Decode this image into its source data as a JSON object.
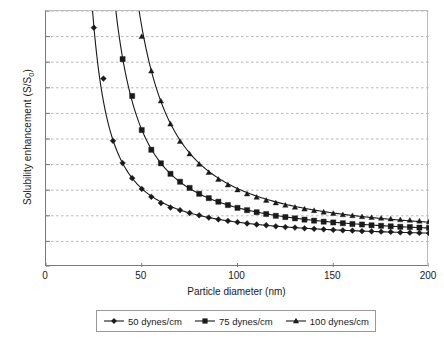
{
  "chart_data": {
    "type": "line",
    "title": "",
    "xlabel": "Particle diameter (nm)",
    "ylabel": "Solubility enhancement (S/S0)",
    "ylabel_main": "Solubility enhancement (S/S",
    "ylabel_sub": "0",
    "ylabel_tail": ")",
    "xlim": [
      0,
      200
    ],
    "ylim": [
      0,
      10
    ],
    "xticks": [
      0,
      50,
      100,
      150,
      200
    ],
    "yticks": [
      0,
      1,
      2,
      3,
      4,
      5,
      6,
      7,
      8,
      9,
      10
    ],
    "grid": "horizontal-dashed",
    "legend_position": "bottom-outside",
    "marker_step_nm": 5,
    "series": [
      {
        "name": "50 dynes/cm",
        "marker": "diamond",
        "color": "#1a1a1a",
        "k_nm": 56,
        "x": [
          25,
          30,
          35,
          40,
          45,
          50,
          55,
          60,
          65,
          70,
          75,
          80,
          85,
          90,
          95,
          100,
          105,
          110,
          115,
          120,
          125,
          130,
          135,
          140,
          145,
          150,
          155,
          160,
          165,
          170,
          175,
          180,
          185,
          190,
          195,
          200
        ],
        "y": [
          9.35,
          7.36,
          4.93,
          4.06,
          3.47,
          3.05,
          2.74,
          2.5,
          2.32,
          2.22,
          2.11,
          2.02,
          1.93,
          1.86,
          1.8,
          1.75,
          1.7,
          1.66,
          1.63,
          1.59,
          1.56,
          1.54,
          1.51,
          1.49,
          1.47,
          1.45,
          1.43,
          1.42,
          1.4,
          1.39,
          1.38,
          1.37,
          1.35,
          1.34,
          1.33,
          1.32
        ]
      },
      {
        "name": "75 dynes/cm",
        "marker": "square",
        "color": "#1a1a1a",
        "k_nm": 84,
        "x": [
          35,
          40,
          45,
          50,
          55,
          60,
          65,
          70,
          75,
          80,
          85,
          90,
          95,
          100,
          105,
          110,
          115,
          120,
          125,
          130,
          135,
          140,
          145,
          150,
          155,
          160,
          165,
          170,
          175,
          180,
          185,
          190,
          195,
          200
        ],
        "y": [
          11.07,
          8.12,
          6.68,
          5.35,
          4.58,
          4.05,
          3.64,
          3.33,
          3.09,
          2.86,
          2.69,
          2.55,
          2.42,
          2.31,
          2.22,
          2.14,
          2.07,
          2.0,
          1.95,
          1.9,
          1.85,
          1.81,
          1.77,
          1.74,
          1.71,
          1.68,
          1.66,
          1.63,
          1.61,
          1.59,
          1.57,
          1.56,
          1.54,
          1.53
        ]
      },
      {
        "name": "100 dynes/cm",
        "marker": "triangle",
        "color": "#1a1a1a",
        "k_nm": 112,
        "x": [
          50,
          55,
          60,
          65,
          70,
          75,
          80,
          85,
          90,
          95,
          100,
          105,
          110,
          115,
          120,
          125,
          130,
          135,
          140,
          145,
          150,
          155,
          160,
          165,
          170,
          175,
          180,
          185,
          190,
          195,
          200
        ],
        "y": [
          9.0,
          7.65,
          6.48,
          5.58,
          4.9,
          4.41,
          4.01,
          3.69,
          3.42,
          3.2,
          3.01,
          2.85,
          2.72,
          2.6,
          2.5,
          2.41,
          2.33,
          2.26,
          2.2,
          2.14,
          2.09,
          2.04,
          2.0,
          1.96,
          1.93,
          1.9,
          1.87,
          1.84,
          1.82,
          1.79,
          1.77
        ]
      }
    ]
  },
  "legend": {
    "items": [
      {
        "label": "50 dynes/cm"
      },
      {
        "label": "75 dynes/cm"
      },
      {
        "label": "100 dynes/cm"
      }
    ]
  }
}
